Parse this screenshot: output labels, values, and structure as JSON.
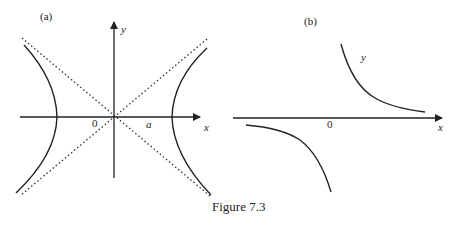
{
  "figure": {
    "caption": "Figure 7.3",
    "panel_a": {
      "label": "(a)",
      "x_axis_label": "x",
      "y_axis_label": "y",
      "origin_label": "0",
      "vertex_label": "a",
      "description": "Hyperbola with two branches opening left and right, vertices at ±a, with dotted asymptotes crossing at the origin"
    },
    "panel_b": {
      "label": "(b)",
      "x_axis_label": "x",
      "curve_label": "y",
      "origin_label": "0",
      "description": "Rectangular hyperbola y = k/x with branches in first and third quadrants, approaching the x-axis"
    }
  },
  "colors": {
    "line": "#222222",
    "background": "#ffffff"
  }
}
